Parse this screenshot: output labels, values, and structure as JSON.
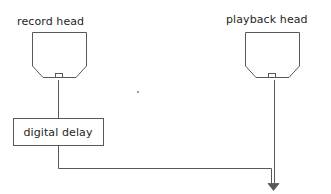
{
  "diagram": {
    "background_color": "#ffffff",
    "stroke_color": "#58585a",
    "text_color": "#231f20",
    "labels": {
      "record_head": "record head",
      "playback_head": "playback head",
      "digital_delay": "digital delay"
    },
    "nodes": [
      {
        "id": "record-head",
        "label": "record head",
        "shape": "tape-head-pentagon",
        "x": 32,
        "y": 32,
        "width": 55,
        "height": 46
      },
      {
        "id": "playback-head",
        "label": "playback head",
        "shape": "tape-head-pentagon",
        "x": 245,
        "y": 32,
        "width": 55,
        "height": 46
      },
      {
        "id": "digital-delay",
        "label": "digital delay",
        "shape": "rectangle",
        "x": 13,
        "y": 118,
        "width": 90,
        "height": 28
      }
    ],
    "connections": [
      {
        "id": "record-head-to-digital-delay",
        "from": "record-head",
        "to": "digital-delay",
        "path": "M 58 80 L 58 118",
        "arrow": false
      },
      {
        "id": "digital-delay-to-sum",
        "from": "digital-delay",
        "to": "summing-point",
        "path": "M 58 146 L 58 168 L 272 168 L 272 184",
        "arrow": true
      },
      {
        "id": "playback-head-to-sum",
        "from": "playback-head",
        "to": "summing-point",
        "path": "M 274 80 L 274 184",
        "arrow": true
      }
    ],
    "markers": [
      {
        "id": "stray-dot",
        "x": 138,
        "y": 92,
        "size": 1.6
      }
    ]
  }
}
